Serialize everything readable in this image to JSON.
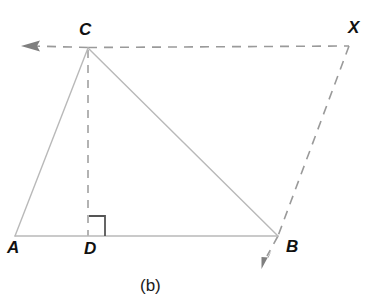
{
  "figure": {
    "caption": "(b)",
    "background_color": "#ffffff",
    "solid_line_color": "#b9b9b9",
    "dashed_line_color": "#9a9a9a",
    "arrow_color": "#808080",
    "right_angle_color": "#555555",
    "label_color": "#111111"
  },
  "labels": {
    "A": "A",
    "B": "B",
    "C": "C",
    "D": "D",
    "X": "X"
  },
  "points": {
    "A": {
      "x": 15,
      "y": 236
    },
    "B": {
      "x": 278,
      "y": 236
    },
    "C": {
      "x": 88,
      "y": 48
    },
    "D": {
      "x": 88,
      "y": 236
    },
    "X": {
      "x": 350,
      "y": 46
    }
  },
  "segments": {
    "AC": {
      "from": "A",
      "to": "C",
      "style": "solid"
    },
    "CB": {
      "from": "C",
      "to": "B",
      "style": "solid"
    },
    "AB": {
      "from": "A",
      "to": "B",
      "style": "solid"
    },
    "CD": {
      "from": "C",
      "to": "D",
      "style": "dashed"
    },
    "CX": {
      "from": "C",
      "to": "X",
      "style": "dashed"
    },
    "XB": {
      "from": "X",
      "to": "B",
      "style": "dashed"
    }
  },
  "rays": {
    "left_ray": {
      "label": "ray-through-C-leftward",
      "arrow_tip": {
        "x": 22,
        "y": 46
      }
    },
    "down_ray": {
      "label": "ray-through-B-downward",
      "arrow_tip": {
        "x": 262,
        "y": 268
      }
    }
  },
  "markers": {
    "right_angle_at_D": {
      "vertex": "D",
      "size": 16,
      "opens": "right-upward"
    }
  }
}
